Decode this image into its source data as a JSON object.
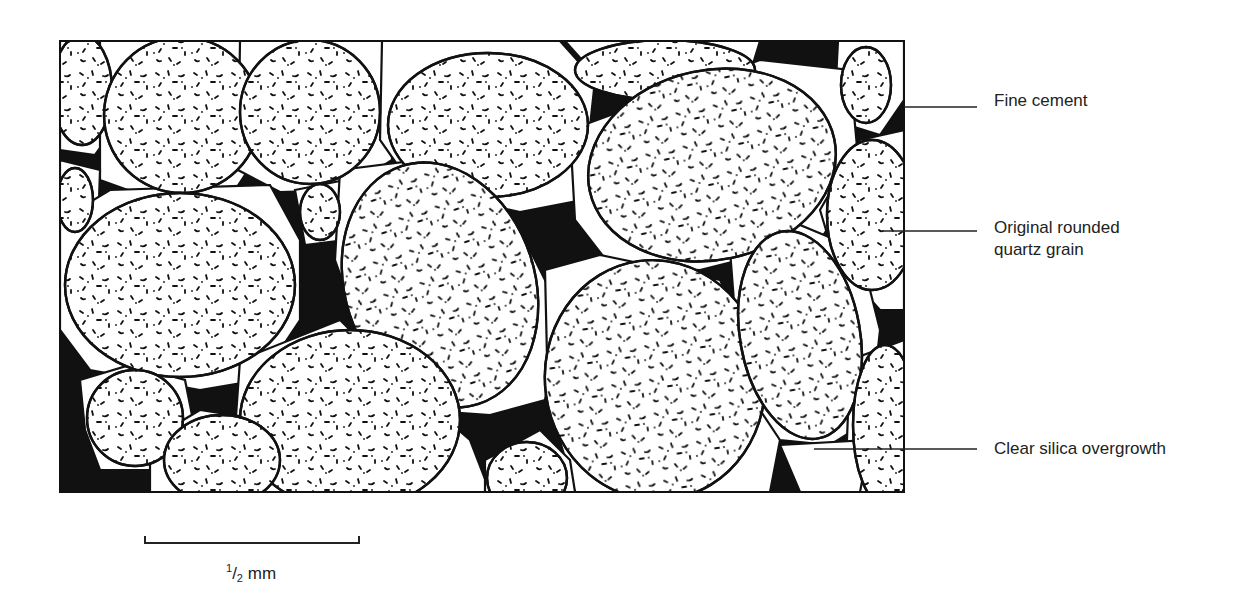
{
  "figure": {
    "type": "thin-section illustration",
    "frame": {
      "x": 60,
      "y": 41,
      "width": 844,
      "height": 451
    }
  },
  "labels": {
    "fine_cement": "Fine cement",
    "grain_line1": "Original rounded",
    "grain_line2": "quartz grain",
    "overgrowth": "Clear silica overgrowth"
  },
  "scale_bar": {
    "numerator": "1",
    "slash": "/",
    "denominator": "2",
    "unit": "mm",
    "x_start": 145,
    "x_end": 359,
    "y": 542
  },
  "colors": {
    "cement": "#111111",
    "grain": "#ffffff",
    "outline": "#111111",
    "text": "#222222"
  }
}
